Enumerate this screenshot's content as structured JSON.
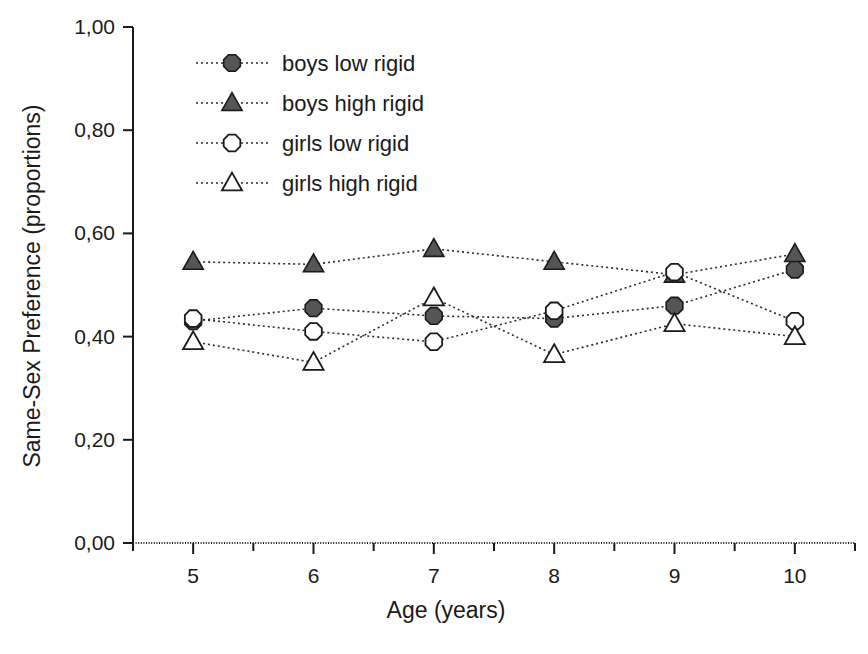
{
  "chart_data": {
    "type": "line",
    "title": "",
    "xlabel": "Age (years)",
    "ylabel": "Same-Sex Preference (proportions)",
    "x": [
      5,
      6,
      7,
      8,
      9,
      10
    ],
    "xtick_labels": [
      "5",
      "6",
      "7",
      "8",
      "9",
      "10"
    ],
    "ytick_labels": [
      "0,00",
      "0,20",
      "0,40",
      "0,60",
      "0,80",
      "1,00"
    ],
    "ytick_values": [
      0.0,
      0.2,
      0.4,
      0.6,
      0.8,
      1.0
    ],
    "xlim": [
      4.5,
      10.5
    ],
    "ylim": [
      0.0,
      1.0
    ],
    "grid": false,
    "legend_position": "upper-left-inside",
    "series": [
      {
        "name": "boys low rigid",
        "marker": "filled-octagon",
        "values": [
          0.43,
          0.455,
          0.44,
          0.435,
          0.46,
          0.53
        ]
      },
      {
        "name": "boys high rigid",
        "marker": "filled-triangle",
        "values": [
          0.545,
          0.54,
          0.57,
          0.545,
          0.52,
          0.56
        ]
      },
      {
        "name": "girls low rigid",
        "marker": "open-octagon",
        "values": [
          0.435,
          0.41,
          0.39,
          0.45,
          0.525,
          0.43
        ]
      },
      {
        "name": "girls high rigid",
        "marker": "open-triangle",
        "values": [
          0.39,
          0.35,
          0.475,
          0.365,
          0.425,
          0.4
        ]
      }
    ],
    "colors": {
      "axis": "#1a1a1a",
      "line": "#2b2b2b",
      "marker_fill": "#555555",
      "marker_open_fill": "#ffffff",
      "background": "#ffffff"
    }
  }
}
